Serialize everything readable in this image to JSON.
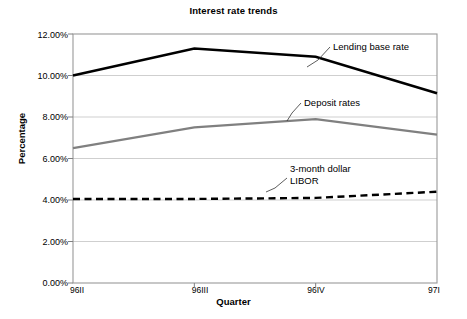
{
  "chart_data": {
    "type": "line",
    "title": "Interest rate trends",
    "xlabel": "Quarter",
    "ylabel": "Percentage",
    "categories": [
      "96II",
      "96III",
      "96IV",
      "97I"
    ],
    "ylim": [
      0,
      12
    ],
    "ytick_labels": [
      "0.00%",
      "2.00%",
      "4.00%",
      "6.00%",
      "8.00%",
      "10.00%",
      "12.00%"
    ],
    "ytick_values": [
      0,
      2,
      4,
      6,
      8,
      10,
      12
    ],
    "grid": true,
    "legend_position": "inline-annotations",
    "series": [
      {
        "name": "Lending base rate",
        "values": [
          10.0,
          11.3,
          10.9,
          9.15
        ],
        "color": "#000000",
        "style": "solid",
        "width": 2.6
      },
      {
        "name": "Deposit rates",
        "values": [
          6.5,
          7.5,
          7.9,
          7.15
        ],
        "color": "#808080",
        "style": "solid",
        "width": 2.2
      },
      {
        "name": "3-month dollar LIBOR",
        "values": [
          4.05,
          4.05,
          4.1,
          4.4
        ],
        "color": "#000000",
        "style": "dashed",
        "width": 2.4
      }
    ],
    "annotations": [
      {
        "text": "Lending base rate",
        "series": "Lending base rate"
      },
      {
        "text": "Deposit rates",
        "series": "Deposit rates"
      },
      {
        "text_line1": "3-month dollar",
        "text_line2": "LIBOR",
        "series": "3-month dollar LIBOR"
      }
    ]
  },
  "colors": {
    "plot_border": "#999999",
    "gridline": "#c9c9c9",
    "axis": "#808080",
    "text": "#000000",
    "background": "#ffffff"
  }
}
